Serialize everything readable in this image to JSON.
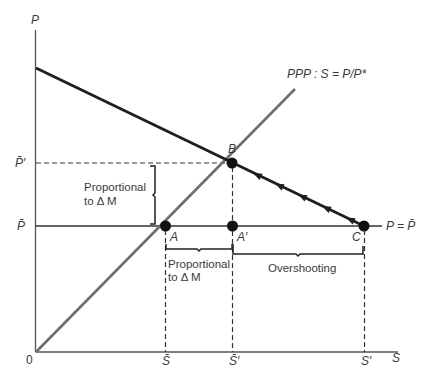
{
  "axes": {
    "y_label": "P",
    "x_label": "S",
    "origin_label": "0"
  },
  "lines": {
    "ppp_label": "PPP : S = P/P*",
    "price_level_label": "P = P̄"
  },
  "points": {
    "A": "A",
    "A_prime": "A′",
    "B": "B",
    "C": "C"
  },
  "y_ticks": {
    "p_bar_prime": "P̄′",
    "p_bar": "P̄"
  },
  "x_ticks": {
    "s_bar": "S̄",
    "s_bar_prime": "S̄′",
    "s_prime": "S′"
  },
  "annotations": {
    "vertical_brace_line1": "Proportional",
    "vertical_brace_line2": "to Δ M",
    "horizontal_brace_line1": "Proportional",
    "horizontal_brace_line2": "to Δ M",
    "overshooting": "Overshooting"
  },
  "colors": {
    "axis": "#555555",
    "ppp_line": "#6e6e6e",
    "adjustment_path": "#1e1e1e",
    "point": "#111111",
    "dashed": "#333333"
  }
}
